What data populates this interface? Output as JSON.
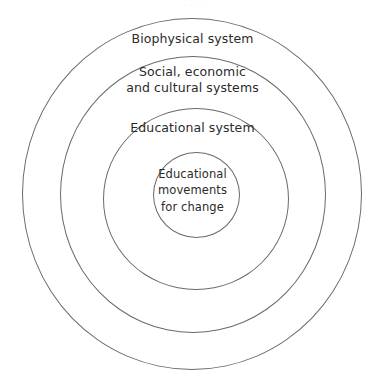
{
  "figure": {
    "type": "concentric-nested-systems",
    "background_color": "#ffffff",
    "stroke_color": "#6a6a6a",
    "text_color": "#2b2b2b",
    "cropped_caption_remnant": "·  ·· ·",
    "rings": [
      {
        "id": "biophysical",
        "level": 1,
        "label": "Biophysical system",
        "name": "ring-biophysical"
      },
      {
        "id": "social",
        "level": 2,
        "label": "Social, economic\nand cultural systems",
        "name": "ring-social"
      },
      {
        "id": "educational-system",
        "level": 3,
        "label": "Educational system",
        "name": "ring-educational-system"
      },
      {
        "id": "educational-movements",
        "level": 4,
        "label": "Educational\nmovements\nfor change",
        "name": "ring-educational-movements"
      }
    ]
  }
}
